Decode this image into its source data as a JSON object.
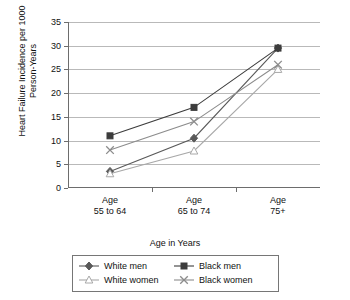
{
  "chart_data": {
    "type": "line",
    "title": "",
    "xlabel": "Age in Years",
    "ylabel": "Heart Failure Incidence per 1000 Person-Years",
    "categories": [
      "Age\n55 to 64",
      "Age\n65 to 74",
      "Age\n75+"
    ],
    "ylim": [
      0,
      35
    ],
    "ytick_values": [
      0,
      5,
      10,
      15,
      20,
      25,
      30,
      35
    ],
    "ytick_labels": [
      "0",
      "5",
      "10",
      "15",
      "20",
      "25",
      "30",
      "35"
    ],
    "grid": true,
    "legend_position": "bottom",
    "series": [
      {
        "name": "White men",
        "marker": "diamond",
        "color": "#595959",
        "values": [
          3.5,
          10.5,
          29.5
        ]
      },
      {
        "name": "Black men",
        "marker": "filled-square",
        "color": "#3c3c3c",
        "values": [
          11.0,
          17.0,
          29.5
        ]
      },
      {
        "name": "White women",
        "marker": "open-triangle",
        "color": "#a8a8a8",
        "values": [
          3.0,
          7.8,
          25.0
        ]
      },
      {
        "name": "Black women",
        "marker": "x-mark",
        "color": "#8c8c8c",
        "values": [
          8.0,
          14.0,
          26.0
        ]
      }
    ]
  },
  "axis": {
    "y_title": "Heart Failure Incidence per 1000 Person-Years",
    "x_title": "Age in Years"
  },
  "legend": {
    "items": [
      {
        "label": "White men",
        "marker": "diamond-icon"
      },
      {
        "label": "Black men",
        "marker": "filled-square-icon"
      },
      {
        "label": "White women",
        "marker": "open-triangle-icon"
      },
      {
        "label": "Black women",
        "marker": "x-mark-icon"
      }
    ]
  }
}
